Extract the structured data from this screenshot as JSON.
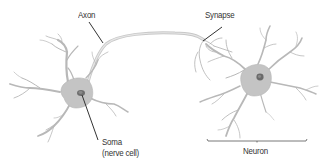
{
  "diagram": {
    "type": "neuron-anatomy",
    "labels": {
      "axon": "Axon",
      "synapse": "Synapse",
      "soma_line1": "Soma",
      "soma_line2": "(nerve cell)",
      "neuron": "Neuron"
    },
    "colors": {
      "background": "#ffffff",
      "cell_body": "#c4c4c4",
      "nucleus": "#6e6e6e",
      "dendrite": "#b8b8b8",
      "axon": "#cfcfcf",
      "leader_line": "#333333",
      "bracket": "#555555",
      "text": "#333333"
    }
  }
}
